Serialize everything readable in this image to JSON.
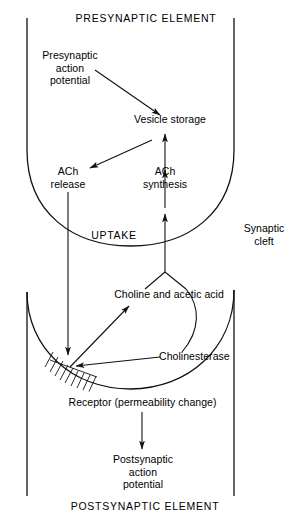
{
  "figure": {
    "type": "diagram",
    "width": 292,
    "height": 520,
    "background_color": "#ffffff",
    "line_color": "#111111",
    "text_color": "#000000"
  },
  "labels": {
    "presynaptic_element": "PRESYNAPTIC ELEMENT",
    "presynaptic_action_potential": "Presynaptic\naction\npotential",
    "vesicle_storage": "Vesicle storage",
    "ach_release": "ACh\nrelease",
    "ach_synthesis": "ACh\nsynthesis",
    "uptake": "UPTAKE",
    "synaptic_cleft": "Synaptic\ncleft",
    "choline_and_acetic_acid": "Choline and acetic acid",
    "cholinesterase": "Cholinesterase",
    "receptor": "Receptor (permeability change)",
    "postsynaptic_action_potential": "Postsynaptic\naction\npotential",
    "postsynaptic_element": "POSTSYNAPTIC ELEMENT"
  },
  "compartments": [
    {
      "name": "presynaptic-element",
      "title": "PRESYNAPTIC ELEMENT",
      "contents": [
        "Presynaptic action potential",
        "Vesicle storage",
        "ACh release",
        "ACh synthesis"
      ]
    },
    {
      "name": "synaptic-cleft",
      "title": "Synaptic cleft",
      "contents": [
        "UPTAKE",
        "Choline and acetic acid",
        "Cholinesterase"
      ]
    },
    {
      "name": "postsynaptic-element",
      "title": "POSTSYNAPTIC ELEMENT",
      "contents": [
        "Receptor (permeability change)",
        "Postsynaptic action potential"
      ]
    }
  ],
  "flow_steps": [
    {
      "from": "Presynaptic action potential",
      "to": "Vesicle storage",
      "style": "arrow-diagonal-down-right"
    },
    {
      "from": "Vesicle storage",
      "to": "ACh release",
      "style": "arrow-diagonal-down-left"
    },
    {
      "from": "ACh synthesis",
      "to": "Vesicle storage",
      "style": "arrow-up"
    },
    {
      "from": "UPTAKE",
      "to": "ACh synthesis",
      "style": "arrow-up"
    },
    {
      "from": "Choline and acetic acid",
      "to": "UPTAKE",
      "style": "arrow-up"
    },
    {
      "from": "ACh release",
      "to": "Receptor (permeability change)",
      "style": "arrow-down"
    },
    {
      "from": "Receptor (permeability change)",
      "to": "Choline and acetic acid",
      "style": "arrow-diagonal-up-right"
    },
    {
      "from": "Cholinesterase",
      "to": "Receptor (permeability change)",
      "style": "arrow-left"
    },
    {
      "from": "Receptor (permeability change)",
      "to": "Postsynaptic action potential",
      "style": "arrow-down"
    }
  ]
}
